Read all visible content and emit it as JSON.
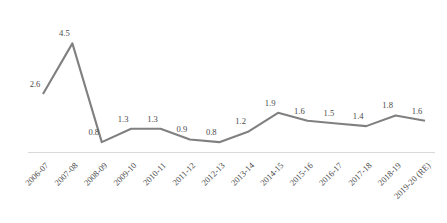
{
  "chart_data": {
    "type": "line",
    "title": "",
    "subtitle": "",
    "xlabel": "",
    "ylabel": "",
    "categories": [
      "2006-07",
      "2007-08",
      "2008-09",
      "2009-10",
      "2010-11",
      "2011-12",
      "2012-13",
      "2013-14",
      "2014-15",
      "2015-16",
      "2016-17",
      "2017-18",
      "2018-19",
      "2019-20 (RE)"
    ],
    "values": [
      2.6,
      4.5,
      0.8,
      1.3,
      1.3,
      0.9,
      0.8,
      1.2,
      1.9,
      1.6,
      1.5,
      1.4,
      1.8,
      1.6
    ],
    "labels": [
      "2.6",
      "4.5",
      "0.8",
      "1.3",
      "1.3",
      "0.9",
      "0.8",
      "1.2",
      "1.9",
      "1.6",
      "1.5",
      "1.4",
      "1.8",
      "1.6"
    ],
    "ylim": [
      0,
      5
    ],
    "grid": false,
    "legend": null,
    "series_color": "#808080",
    "axis_color": "#d9d9d9",
    "label_color": "#4a4a4a",
    "label_rotation_deg": -45
  }
}
